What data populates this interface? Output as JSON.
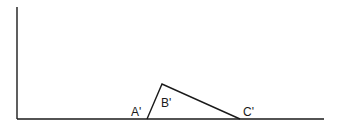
{
  "diagram": {
    "stroke_color": "#1a1a1a",
    "axes": {
      "origin": [
        17,
        119
      ],
      "y_top": [
        17,
        7
      ],
      "x_right": [
        324,
        119
      ]
    },
    "triangle": {
      "vertices": {
        "A": [
          147,
          119
        ],
        "B": [
          162,
          84
        ],
        "C": [
          240,
          119
        ]
      },
      "labels": {
        "A": "A'",
        "B": "B'",
        "C": "C'"
      }
    }
  }
}
